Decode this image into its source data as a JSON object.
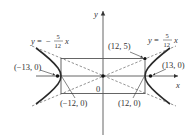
{
  "figure": {
    "type": "hyperbola",
    "equation_params": {
      "a": 12,
      "b": 5,
      "c": 13
    },
    "axes": {
      "x_label": "x",
      "y_label": "y",
      "origin_label": "0"
    },
    "asymptotes": [
      {
        "label_prefix": "y = ",
        "sign": "−",
        "numerator": "5",
        "denominator": "12",
        "var": "x"
      },
      {
        "label_prefix": "y = ",
        "sign": "",
        "numerator": "5",
        "denominator": "12",
        "var": "x"
      }
    ],
    "points": [
      {
        "label": "(−13, 0)",
        "role": "focus-left"
      },
      {
        "label": "(13, 0)",
        "role": "focus-right"
      },
      {
        "label": "(−12, 0)",
        "role": "vertex-left"
      },
      {
        "label": "(12, 0)",
        "role": "vertex-right"
      },
      {
        "label": "(12, 5)",
        "role": "rectangle-corner"
      }
    ]
  },
  "colors": {
    "curve": "#2a2a2a",
    "axis": "#555555",
    "asymptote": "#777777",
    "rectangle": "#555555",
    "text": "#333333"
  }
}
